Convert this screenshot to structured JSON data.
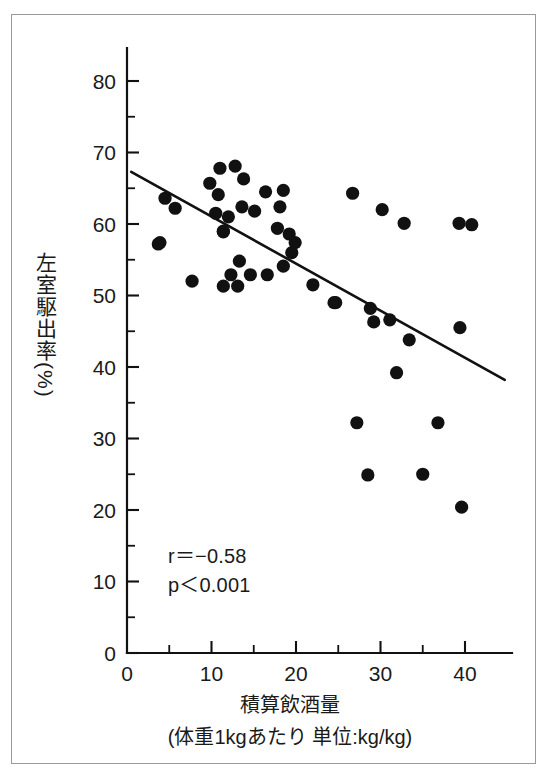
{
  "figure": {
    "border_color": "#9a9a9a",
    "background": "#ffffff",
    "point_color": "#111111",
    "line_color": "#111111"
  },
  "labels": {
    "y_axis_title": "左室駆出率(%)",
    "x_axis_title": "積算飲酒量",
    "x_axis_subtitle": "(体重1kgあたり 単位:kg/kg)",
    "annotation_r": "r＝−0.58",
    "annotation_p": "p＜0.001"
  },
  "chart_data": {
    "type": "scatter",
    "title": "",
    "xlabel": "積算飲酒量 (体重1kgあたり 単位:kg/kg)",
    "ylabel": "左室駆出率(%)",
    "xlim": [
      0,
      44.5
    ],
    "ylim": [
      0,
      84
    ],
    "x_ticks": [
      0,
      10,
      20,
      30,
      40
    ],
    "y_ticks": [
      0,
      10,
      20,
      30,
      40,
      50,
      60,
      70,
      80
    ],
    "x_minor_ticks": [
      5,
      15,
      25,
      35
    ],
    "y_minor_ticks": [
      5,
      15,
      25,
      35,
      45,
      55,
      65,
      75
    ],
    "grid": false,
    "legend": false,
    "correlation_r": -0.58,
    "p_value_text": "p<0.001",
    "annotations": [
      "r＝−0.58",
      "p＜0.001"
    ],
    "trend_line": {
      "x0": 0.5,
      "y0": 67.3,
      "x1": 44.7,
      "y1": 38.2
    },
    "point_radius_px": 6.6,
    "points": [
      [
        3.7,
        57.2
      ],
      [
        3.9,
        57.4
      ],
      [
        4.5,
        63.6
      ],
      [
        5.7,
        62.2
      ],
      [
        7.7,
        52.0
      ],
      [
        9.8,
        65.7
      ],
      [
        10.5,
        61.5
      ],
      [
        10.8,
        64.1
      ],
      [
        11.0,
        67.8
      ],
      [
        11.4,
        51.3
      ],
      [
        11.4,
        58.9
      ],
      [
        11.4,
        59.0
      ],
      [
        12.0,
        61.0
      ],
      [
        12.3,
        52.9
      ],
      [
        12.8,
        68.1
      ],
      [
        13.1,
        51.3
      ],
      [
        13.3,
        54.8
      ],
      [
        13.6,
        62.4
      ],
      [
        13.8,
        66.3
      ],
      [
        14.6,
        52.9
      ],
      [
        15.1,
        61.8
      ],
      [
        16.4,
        64.5
      ],
      [
        16.6,
        52.9
      ],
      [
        17.8,
        59.4
      ],
      [
        18.1,
        62.4
      ],
      [
        18.5,
        54.1
      ],
      [
        18.5,
        64.7
      ],
      [
        19.2,
        58.6
      ],
      [
        19.9,
        57.4
      ],
      [
        19.5,
        56.0
      ],
      [
        22.0,
        51.5
      ],
      [
        24.5,
        49.0
      ],
      [
        24.7,
        49.0
      ],
      [
        26.7,
        64.3
      ],
      [
        27.2,
        32.2
      ],
      [
        28.5,
        24.9
      ],
      [
        28.8,
        48.2
      ],
      [
        29.2,
        46.3
      ],
      [
        30.2,
        62.0
      ],
      [
        31.1,
        46.6
      ],
      [
        31.9,
        39.2
      ],
      [
        32.8,
        60.1
      ],
      [
        33.4,
        43.8
      ],
      [
        35.0,
        25.0
      ],
      [
        36.8,
        32.2
      ],
      [
        39.3,
        60.1
      ],
      [
        39.4,
        45.5
      ],
      [
        39.6,
        20.4
      ],
      [
        40.8,
        59.9
      ]
    ]
  },
  "geometry": {
    "origin_x_px": 127,
    "origin_y_px": 653,
    "px_per_x_unit": 8.45,
    "px_per_y_unit": 7.15,
    "y_axis_top_px": 48,
    "x_axis_right_px": 512
  }
}
